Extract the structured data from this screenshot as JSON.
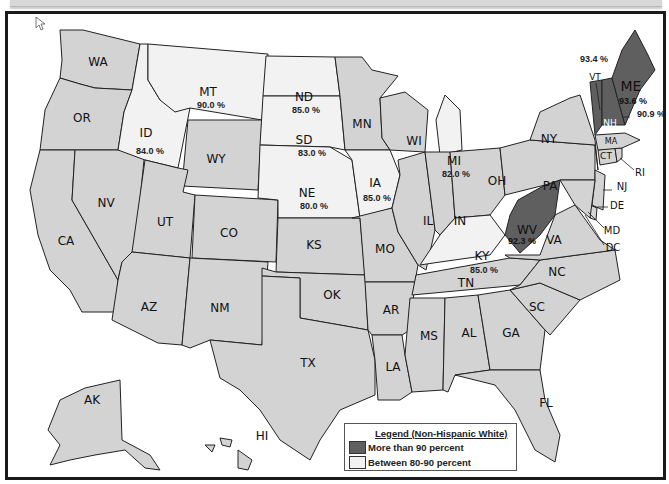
{
  "map": {
    "title": "Non-Hispanic White population share by US state",
    "colors": {
      "over_90": "#5f5f5f",
      "between_80_90": "#f2f2f2",
      "other": "#d3d3d3",
      "border": "#222222"
    },
    "states": {
      "WA": {
        "label": "WA",
        "category": "other"
      },
      "OR": {
        "label": "OR",
        "category": "other"
      },
      "CA": {
        "label": "CA",
        "category": "other"
      },
      "NV": {
        "label": "NV",
        "category": "other"
      },
      "ID": {
        "label": "ID",
        "value": "84.0 %",
        "category": "between_80_90"
      },
      "MT": {
        "label": "MT",
        "value": "90.0 %",
        "category": "between_80_90"
      },
      "WY": {
        "label": "WY",
        "category": "other"
      },
      "UT": {
        "label": "UT",
        "category": "other"
      },
      "CO": {
        "label": "CO",
        "category": "other"
      },
      "AZ": {
        "label": "AZ",
        "category": "other"
      },
      "NM": {
        "label": "NM",
        "category": "other"
      },
      "ND": {
        "label": "ND",
        "value": "85.0 %",
        "category": "between_80_90"
      },
      "SD": {
        "label": "SD",
        "value": "83.0 %",
        "category": "between_80_90"
      },
      "NE": {
        "label": "NE",
        "value": "80.0 %",
        "category": "between_80_90"
      },
      "KS": {
        "label": "KS",
        "category": "other"
      },
      "OK": {
        "label": "OK",
        "category": "other"
      },
      "TX": {
        "label": "TX",
        "category": "other"
      },
      "MN": {
        "label": "MN",
        "category": "other"
      },
      "IA": {
        "label": "IA",
        "value": "85.0 %",
        "category": "between_80_90"
      },
      "MO": {
        "label": "MO",
        "category": "other"
      },
      "AR": {
        "label": "AR",
        "category": "other"
      },
      "LA": {
        "label": "LA",
        "category": "other"
      },
      "WI": {
        "label": "WI",
        "category": "other"
      },
      "IL": {
        "label": "IL",
        "category": "other"
      },
      "MI": {
        "label": "MI",
        "value": "82.0 %",
        "category": "between_80_90"
      },
      "IN": {
        "label": "IN",
        "category": "other"
      },
      "OH": {
        "label": "OH",
        "category": "other"
      },
      "KY": {
        "label": "KY",
        "value": "85.0 %",
        "category": "between_80_90"
      },
      "TN": {
        "label": "TN",
        "category": "other"
      },
      "MS": {
        "label": "MS",
        "category": "other"
      },
      "AL": {
        "label": "AL",
        "category": "other"
      },
      "GA": {
        "label": "GA",
        "category": "other"
      },
      "FL": {
        "label": "FL",
        "category": "other"
      },
      "SC": {
        "label": "SC",
        "category": "other"
      },
      "NC": {
        "label": "NC",
        "category": "other"
      },
      "VA": {
        "label": "VA",
        "category": "other"
      },
      "WV": {
        "label": "WV",
        "value": "92.3 %",
        "category": "over_90"
      },
      "PA": {
        "label": "PA",
        "category": "other"
      },
      "NY": {
        "label": "NY",
        "category": "other"
      },
      "NJ": {
        "label": "NJ",
        "category": "other"
      },
      "DE": {
        "label": "DE",
        "category": "other"
      },
      "MD": {
        "label": "MD",
        "category": "other"
      },
      "DC": {
        "label": "DC",
        "category": "other"
      },
      "CT": {
        "label": "CT",
        "category": "other"
      },
      "RI": {
        "label": "RI",
        "category": "other"
      },
      "MA": {
        "label": "MA",
        "category": "other"
      },
      "VT": {
        "label": "VT",
        "value": "93.4 %",
        "category": "over_90"
      },
      "NH": {
        "label": "NH",
        "value": "90.9 %",
        "category": "over_90"
      },
      "ME": {
        "label": "ME",
        "value": "93.6 %",
        "category": "over_90"
      },
      "AK": {
        "label": "AK",
        "category": "other"
      },
      "HI": {
        "label": "HI",
        "category": "other"
      }
    }
  },
  "legend": {
    "title": "Legend (Non-Hispanic White)",
    "items": [
      {
        "label": "More than 90 percent",
        "color": "#5f5f5f"
      },
      {
        "label": "Between 80-90 percent",
        "color": "#f2f2f2"
      }
    ]
  }
}
